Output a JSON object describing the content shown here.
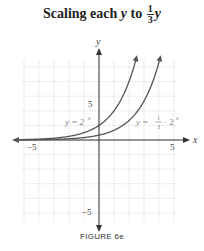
{
  "title": {
    "prefix": "Scaling each ",
    "var": "y",
    "mid": " to ",
    "frac_num": "1",
    "frac_den": "3",
    "suffix_var": "y"
  },
  "axes": {
    "x_label": "x",
    "y_label": "y",
    "x_tick_neg": "−5",
    "x_tick_pos": "5",
    "y_tick_pos": "5",
    "y_tick_neg": "−5"
  },
  "curve_labels": {
    "original": "y = 2",
    "original_exp": "x",
    "scaled_prefix": "y =",
    "scaled_frac_num": "1",
    "scaled_frac_den": "3",
    "scaled_suffix": "· 2",
    "scaled_exp": "x"
  },
  "caption": "FIGURE 6e",
  "colors": {
    "curve": "#555555",
    "grid": "#cfcfcf",
    "axis": "#333333",
    "label": "#888888"
  },
  "chart_data": {
    "type": "line",
    "xlabel": "x",
    "ylabel": "y",
    "xlim": [
      -5,
      5
    ],
    "ylim": [
      -5,
      5
    ],
    "grid": true,
    "x_ticks": [
      -5,
      5
    ],
    "y_ticks": [
      -5,
      5
    ],
    "series": [
      {
        "name": "y = 2^x",
        "function": "2^x",
        "x": [
          -5,
          -4,
          -3,
          -2,
          -1,
          0,
          1,
          2,
          2.6
        ],
        "values": [
          0.03,
          0.06,
          0.13,
          0.25,
          0.5,
          1,
          2,
          4,
          6.1
        ]
      },
      {
        "name": "y = 1/3 · 2^x",
        "function": "(1/3)*2^x",
        "x": [
          -5,
          -4,
          -3,
          -2,
          -1,
          0,
          1,
          2,
          3,
          4.2
        ],
        "values": [
          0.01,
          0.02,
          0.04,
          0.08,
          0.17,
          0.33,
          0.67,
          1.33,
          2.67,
          6.1
        ]
      }
    ],
    "annotations": [
      "y = 2^x",
      "y = 1/3 · 2^x"
    ],
    "caption": "FIGURE 6e"
  }
}
